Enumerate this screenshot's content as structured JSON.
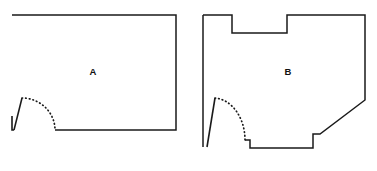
{
  "canvas": {
    "width": 377,
    "height": 171,
    "background": "#ffffff"
  },
  "style": {
    "line_color": "#1a1a1a",
    "label_color": "#111111",
    "line_width": 1.5,
    "swing_style": "dotted"
  },
  "figure": {
    "type": "floor-plan-comparison",
    "shape_count": 2
  },
  "shapes": [
    {
      "id": "shape-a",
      "label": "A",
      "label_x": 93,
      "label_y": 72,
      "description": "rectangular room with a single door on the lower left wall",
      "outline_points": "12,15 176,15 176,130 55,130",
      "door": {
        "hinge_x": 22,
        "hinge_y": 98,
        "leaf_end_x": 14,
        "leaf_end_y": 130,
        "jamb_x": 12,
        "jamb_y": 130,
        "arc_end_x": 55,
        "arc_end_y": 130,
        "arc_path": "M 22,98 A 33,32 0 0 1 55,130",
        "leaf_path": "M 22,98 L 14,130",
        "jamb_path": "M 12,116 L 12,130 L 14,130"
      }
    },
    {
      "id": "shape-b",
      "label": "B",
      "label_x": 288,
      "label_y": 72,
      "description": "irregular room with a top notch, an angled lower-right corner, a bottom step and a single door on the lower left wall",
      "outline_points": "203,15 232,15 232,33 287,33 287,15 365,15 365,100 320,134 313,134 313,148 250,148 250,140 245,140",
      "left_wall_path": "M 203,15 L 203,147",
      "door": {
        "hinge_x": 215,
        "hinge_y": 98,
        "leaf_end_x": 207,
        "leaf_end_y": 147,
        "arc_end_x": 245,
        "arc_end_y": 140,
        "arc_path": "M 215,98 A 32,42 0 0 1 245,140",
        "leaf_path": "M 215,98 L 207,147"
      }
    }
  ]
}
